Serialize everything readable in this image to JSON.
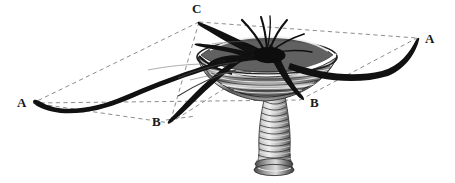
{
  "figure": {
    "name": "stalked-polyp-tentacle-geometry-engraving",
    "title": "",
    "background_color": "#ffffff",
    "ink_color": "#1a1a1a",
    "dash_color": "#8a8a8a",
    "shade_color": "#7d7d7d"
  },
  "labels": [
    {
      "id": "A-right",
      "text": "A",
      "x": 425,
      "y": 32
    },
    {
      "id": "A-left",
      "text": "A",
      "x": 17,
      "y": 96
    },
    {
      "id": "B-left",
      "text": "B",
      "x": 152,
      "y": 115
    },
    {
      "id": "B-right",
      "text": "B",
      "x": 310,
      "y": 96
    },
    {
      "id": "C-top",
      "text": "C",
      "x": 192,
      "y": 2
    }
  ],
  "geometry": {
    "vertices": {
      "A_right": [
        417,
        38
      ],
      "A_left": [
        33,
        103
      ],
      "B_left": [
        170,
        123
      ],
      "B_right": [
        300,
        100
      ],
      "C_top": [
        199,
        22
      ],
      "apex": [
        264,
        62
      ]
    },
    "dashed_edges": [
      [
        "C_top",
        "A_right"
      ],
      [
        "C_top",
        "A_left"
      ],
      [
        "A_left",
        "B_left"
      ],
      [
        "A_left",
        "B_right"
      ],
      [
        "C_top",
        "B_left"
      ],
      [
        "B_left",
        "apex"
      ],
      [
        "B_right",
        "A_right"
      ]
    ]
  },
  "anatomy": {
    "calyx_label": "funnel-shaped calyx",
    "stalk_label": "annulated stalk",
    "tentacle_count": 8,
    "stalk_rings": 13
  }
}
